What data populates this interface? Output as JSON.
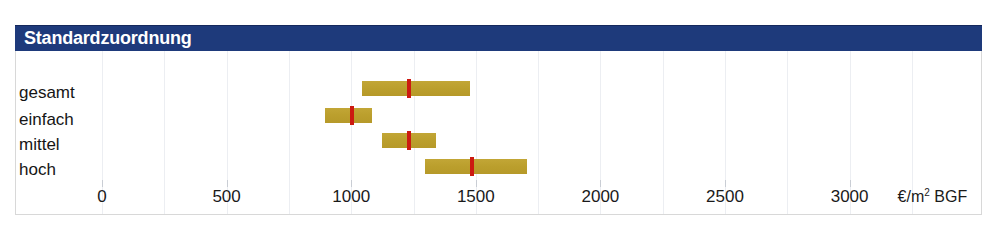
{
  "header": {
    "title": "Standardzuordnung",
    "bg_color": "#1e3a7b",
    "text_color": "#ffffff"
  },
  "axis": {
    "unit_label": "€/m² BGF",
    "unit_prefix": "€/m",
    "unit_sup": "2",
    "unit_suffix": " BGF",
    "ticks": [
      {
        "label": "0",
        "value": 0
      },
      {
        "label": "500",
        "value": 500
      },
      {
        "label": "1000",
        "value": 1000
      },
      {
        "label": "1500",
        "value": 1500
      },
      {
        "label": "2000",
        "value": 2000
      },
      {
        "label": "2500",
        "value": 2500
      },
      {
        "label": "3000",
        "value": 3000
      }
    ],
    "minor_ticks": [
      250,
      750,
      1250,
      1750,
      2250,
      2750,
      3250
    ],
    "min": 0,
    "max": 3500
  },
  "colors": {
    "bar": "#bb9f2d",
    "median": "#cc1a11",
    "grid": "#eceef2",
    "frame": "#d8d8d8"
  },
  "chart_data": {
    "type": "bar",
    "title": "Standardzuordnung",
    "xlabel": "€/m² BGF",
    "ylabel": "",
    "xlim": [
      0,
      3500
    ],
    "grid": true,
    "legend": null,
    "orientation": "horizontal",
    "categories": [
      "gesamt",
      "einfach",
      "mittel",
      "hoch"
    ],
    "series": [
      {
        "name": "von",
        "values": [
          1045,
          895,
          1125,
          1295
        ]
      },
      {
        "name": "median",
        "values": [
          1230,
          1005,
          1230,
          1485
        ]
      },
      {
        "name": "bis",
        "values": [
          1475,
          1085,
          1340,
          1705
        ]
      }
    ],
    "rows": [
      {
        "label": "gesamt",
        "from": 1045,
        "median": 1230,
        "to": 1475
      },
      {
        "label": "einfach",
        "from": 895,
        "median": 1005,
        "to": 1085
      },
      {
        "label": "mittel",
        "from": 1125,
        "median": 1230,
        "to": 1340
      },
      {
        "label": "hoch",
        "from": 1295,
        "median": 1485,
        "to": 1705
      }
    ]
  }
}
